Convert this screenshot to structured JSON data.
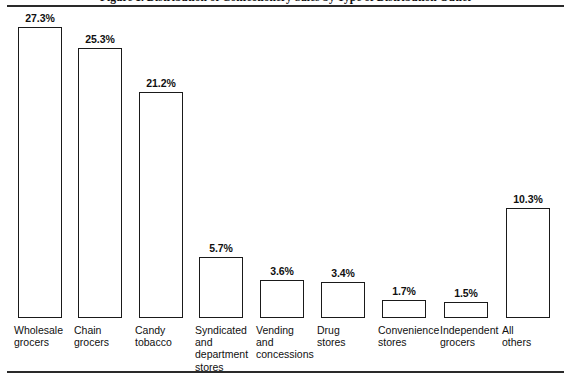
{
  "chart_data": {
    "type": "bar",
    "title": "Figure 1. Distribution of Confectionery Sales by Type of Distribution Outlet",
    "xlabel": "",
    "ylabel": "",
    "ylim": [
      0,
      29
    ],
    "grid": false,
    "legend": "none",
    "value_suffix": "%",
    "categories": [
      "Wholesale\ngrocers",
      "Chain\ngrocers",
      "Candy\ntobacco",
      "Syndicated\nand\ndepartment\nstores",
      "Vending\nand\nconcessions",
      "Drug\nstores",
      "Convenience\nstores",
      "Independent\ngrocers",
      "All\nothers"
    ],
    "values": [
      27.3,
      25.3,
      21.2,
      5.7,
      3.6,
      3.4,
      1.7,
      1.5,
      10.3
    ],
    "value_labels": [
      "27.3%",
      "25.3%",
      "21.2%",
      "5.7%",
      "3.6%",
      "3.4%",
      "1.7%",
      "1.5%",
      "10.3%"
    ],
    "bar_color": "#ffffff",
    "bar_edge_color": "#1a1a1a",
    "rule_color": "#2a2a2a"
  },
  "layout": {
    "baseline_y": 318,
    "px_per_percent": 10.66,
    "bar_width": 44,
    "bar_lefts": [
      18,
      78,
      139,
      199,
      260,
      321,
      382,
      444,
      506
    ],
    "label_lefts": [
      14,
      74,
      135,
      195,
      256,
      317,
      378,
      440,
      502
    ],
    "label_top": 324
  }
}
